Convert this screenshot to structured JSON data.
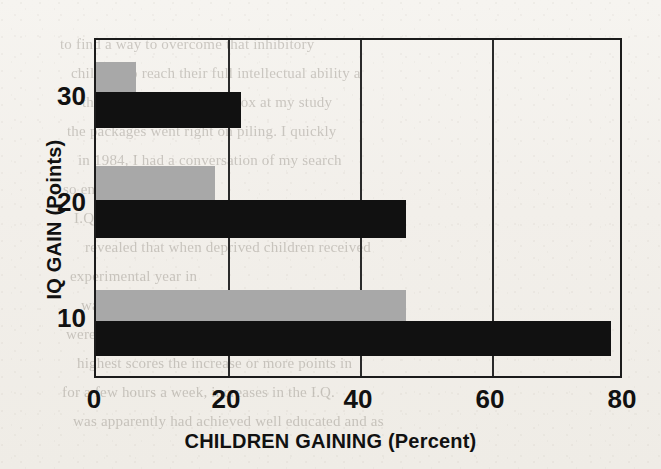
{
  "page": {
    "kind": "scanned-book-page-with-figure",
    "ghost_text_lines": [
      "to find a way to overcome that inhibitory",
      "children to reach their full intellectual ability a",
      "the next month, the mailbox at my study",
      "the packages went right on piling. I quickly",
      "in 1984, I had a conversation of my search",
      "so enraptured by the",
      "I.Q. The most effective",
      "revealed that when deprived children received",
      "experimental year in",
      "was the most astonishing rise in the I.Q.",
      "were in one control group but also the children",
      "highest scores the increase or more points in",
      "for a few hours a week, increases in the I.Q.",
      "was apparently had achieved well educated and as"
    ]
  },
  "chart_data": {
    "type": "bar",
    "orientation": "horizontal",
    "title": "",
    "xlabel": "CHILDREN GAINING (Percent)",
    "ylabel": "IQ GAIN (Points)",
    "categories": [
      "10",
      "20",
      "30"
    ],
    "xticks": [
      "0",
      "20",
      "40",
      "60",
      "80"
    ],
    "xlim": [
      0,
      80
    ],
    "grid": "vertical",
    "legend": "none",
    "series": [
      {
        "name": "dark",
        "color": "#111111",
        "values": [
          78,
          47,
          22
        ]
      },
      {
        "name": "light",
        "color": "#a8a8a8",
        "values": [
          47,
          18,
          6
        ]
      }
    ],
    "bars": [
      {
        "category": "30",
        "series": "light",
        "value": 6,
        "color": "#a8a8a8",
        "top": 60,
        "height": 30
      },
      {
        "category": "30",
        "series": "dark",
        "value": 22,
        "color": "#111111",
        "top": 90,
        "height": 36
      },
      {
        "category": "20",
        "series": "light",
        "value": 18,
        "color": "#a8a8a8",
        "top": 164,
        "height": 34
      },
      {
        "category": "20",
        "series": "dark",
        "value": 47,
        "color": "#111111",
        "top": 198,
        "height": 38
      },
      {
        "category": "10",
        "series": "light",
        "value": 47,
        "color": "#a8a8a8",
        "top": 288,
        "height": 31
      },
      {
        "category": "10",
        "series": "dark",
        "value": 78,
        "color": "#111111",
        "top": 319,
        "height": 35
      }
    ],
    "axis_geometry": {
      "plot_left_px": 94,
      "plot_top_px": 38,
      "plot_width_px": 528,
      "plot_height_px": 340,
      "px_per_unit": 6.6
    },
    "ytick_positions_px": [
      318,
      202,
      96
    ]
  }
}
